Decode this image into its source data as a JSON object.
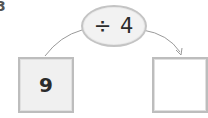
{
  "question": {
    "number": "3"
  },
  "machine": {
    "operation": "÷ 4",
    "operator": "÷",
    "operand": "4"
  },
  "input_box": {
    "value": "9"
  },
  "output_box": {
    "value": ""
  },
  "colors": {
    "box_border": "#bdbdbd",
    "input_fill": "#f0f0f0",
    "oval_fill": "#f2f2f2",
    "arrow": "#9a9a9a",
    "text": "#2b2b2b"
  }
}
